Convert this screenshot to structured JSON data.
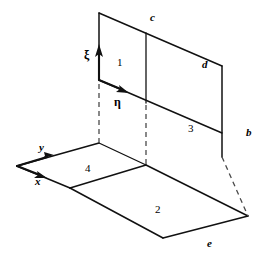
{
  "figure": {
    "background_color": "#ffffff",
    "line_color": "#111111",
    "hidden_line_color": "#4a4a4a"
  },
  "faces": [
    {
      "id": "face-1",
      "label": "1",
      "x": 117,
      "y": 57
    },
    {
      "id": "face-2",
      "label": "2",
      "x": 155,
      "y": 204
    },
    {
      "id": "face-3",
      "label": "3",
      "x": 188,
      "y": 123
    },
    {
      "id": "face-4",
      "label": "4",
      "x": 85,
      "y": 163
    }
  ],
  "edges": [
    {
      "id": "edge-c",
      "label": "c",
      "x": 150,
      "y": 12
    },
    {
      "id": "edge-d",
      "label": "d",
      "x": 202,
      "y": 59
    },
    {
      "id": "edge-b",
      "label": "b",
      "x": 246,
      "y": 127
    },
    {
      "id": "edge-e",
      "label": "e",
      "x": 207,
      "y": 238
    }
  ],
  "axes": [
    {
      "id": "axis-y",
      "label": "y",
      "x": 39,
      "y": 142
    },
    {
      "id": "axis-x",
      "label": "x",
      "x": 35,
      "y": 176
    }
  ],
  "local_coordinates": [
    {
      "id": "axis-xi",
      "label": "ξ",
      "x": 84,
      "y": 49
    },
    {
      "id": "axis-eta",
      "label": "η",
      "x": 114,
      "y": 96
    }
  ],
  "geometry": {
    "solid_edges": [
      {
        "name": "top-edge-c",
        "x1": 99,
        "y1": 13,
        "x2": 222,
        "y2": 66
      },
      {
        "name": "upper-left-vertical",
        "x1": 99,
        "y1": 13,
        "x2": 99,
        "y2": 80
      },
      {
        "name": "mid-vertical-upper",
        "x1": 146,
        "y1": 33,
        "x2": 146,
        "y2": 103
      },
      {
        "name": "eta-edge",
        "x1": 99,
        "y1": 80,
        "x2": 222,
        "y2": 133
      },
      {
        "name": "right-vertical-b",
        "x1": 222,
        "y1": 66,
        "x2": 222,
        "y2": 157
      },
      {
        "name": "floor-y-edge",
        "x1": 17,
        "y1": 166,
        "x2": 99,
        "y2": 143
      },
      {
        "name": "floor-x-edge",
        "x1": 17,
        "y1": 166,
        "x2": 70,
        "y2": 188
      },
      {
        "name": "face4-right-edge",
        "x1": 99,
        "y1": 143,
        "x2": 146,
        "y2": 165
      },
      {
        "name": "face4-front-edge",
        "x1": 70,
        "y1": 188,
        "x2": 146,
        "y2": 165
      },
      {
        "name": "face2-left-edge",
        "x1": 70,
        "y1": 188,
        "x2": 163,
        "y2": 238
      },
      {
        "name": "face2-bottom-edge",
        "x1": 163,
        "y1": 238,
        "x2": 248,
        "y2": 216
      },
      {
        "name": "face2-right-edge",
        "x1": 146,
        "y1": 165,
        "x2": 248,
        "y2": 216
      }
    ],
    "hidden_edges": [
      {
        "name": "hidden-left-vertical",
        "x1": 99,
        "y1": 82,
        "x2": 99,
        "y2": 143
      },
      {
        "name": "hidden-mid-vertical",
        "x1": 146,
        "y1": 103,
        "x2": 146,
        "y2": 165
      },
      {
        "name": "hidden-right-vertical",
        "x1": 222,
        "y1": 157,
        "x2": 248,
        "y2": 216
      }
    ],
    "arrows": [
      {
        "name": "xi-arrow",
        "x1": 99,
        "y1": 80,
        "x2": 99,
        "y2": 46
      },
      {
        "name": "eta-arrow",
        "x1": 99,
        "y1": 80,
        "x2": 127,
        "y2": 92
      },
      {
        "name": "y-arrow",
        "x1": 17,
        "y1": 166,
        "x2": 52,
        "y2": 156
      },
      {
        "name": "x-arrow",
        "x1": 17,
        "y1": 166,
        "x2": 45,
        "y2": 177
      }
    ]
  }
}
